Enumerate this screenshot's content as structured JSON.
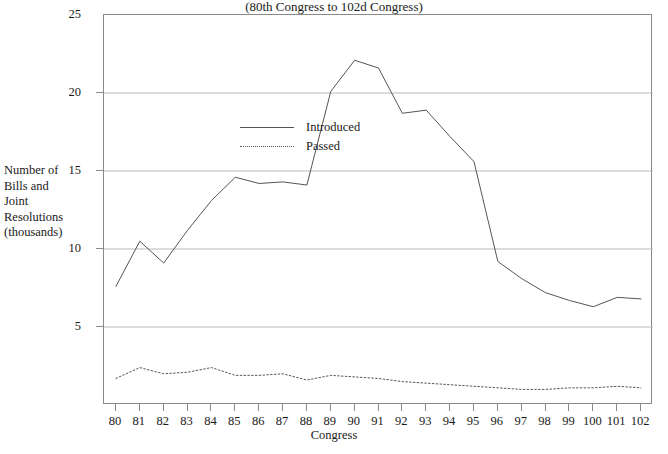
{
  "chart_data": {
    "type": "line",
    "title": "Bills and Joint Resolutions Introduced and Passed",
    "subtitle": "(80th Congress to 102d Congress)",
    "xlabel": "Congress",
    "ylabel": "Number of\nBills and\nJoint\nResolutions\n(thousands)",
    "categories": [
      "80",
      "81",
      "82",
      "83",
      "84",
      "85",
      "86",
      "87",
      "88",
      "89",
      "90",
      "91",
      "92",
      "93",
      "94",
      "95",
      "96",
      "97",
      "98",
      "99",
      "100",
      "101",
      "102"
    ],
    "x": [
      80,
      81,
      82,
      83,
      84,
      85,
      86,
      87,
      88,
      89,
      90,
      91,
      92,
      93,
      94,
      95,
      96,
      97,
      98,
      99,
      100,
      101,
      102
    ],
    "xlim": [
      79.5,
      102.5
    ],
    "ylim": [
      0,
      25
    ],
    "yticks": [
      5,
      10,
      15,
      20,
      25
    ],
    "xticks": [
      80,
      81,
      82,
      83,
      84,
      85,
      86,
      87,
      88,
      89,
      90,
      91,
      92,
      93,
      94,
      95,
      96,
      97,
      98,
      99,
      100,
      101,
      102
    ],
    "grid": "horizontal",
    "legend_position": "upper-left-inside",
    "series": [
      {
        "name": "Introduced",
        "style": "solid",
        "color": "#555555",
        "values": [
          7.6,
          10.5,
          9.1,
          11.2,
          13.1,
          14.6,
          14.2,
          14.3,
          14.1,
          20.1,
          22.1,
          21.6,
          18.7,
          18.9,
          17.2,
          15.6,
          9.2,
          8.1,
          7.2,
          6.7,
          6.3,
          6.9,
          6.8
        ]
      },
      {
        "name": "Passed",
        "style": "dotted",
        "color": "#555555",
        "values": [
          1.7,
          2.4,
          2.0,
          2.1,
          2.4,
          1.9,
          1.9,
          2.0,
          1.6,
          1.9,
          1.8,
          1.7,
          1.5,
          1.4,
          1.3,
          1.2,
          1.1,
          1.0,
          1.0,
          1.1,
          1.1,
          1.2,
          1.1
        ]
      }
    ]
  },
  "colors": {
    "axis": "#8a8a8a",
    "grid": "#b9b9b9",
    "line": "#555555",
    "text": "#1a1a1a",
    "background": "#ffffff"
  }
}
